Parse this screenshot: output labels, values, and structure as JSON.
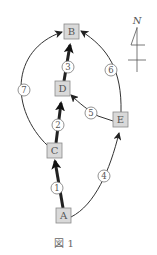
{
  "figure": {
    "caption": "図 1",
    "north_label": "N"
  },
  "nodes": {
    "A": "A",
    "B": "B",
    "C": "C",
    "D": "D",
    "E": "E"
  },
  "edges": [
    {
      "id": "1",
      "label": "1",
      "from": "A",
      "to": "C",
      "weight": "thick"
    },
    {
      "id": "2",
      "label": "2",
      "from": "C",
      "to": "D",
      "weight": "thick"
    },
    {
      "id": "3",
      "label": "3",
      "from": "D",
      "to": "B",
      "weight": "thick"
    },
    {
      "id": "4",
      "label": "4",
      "from": "A",
      "to": "E",
      "weight": "thin"
    },
    {
      "id": "5",
      "label": "5",
      "from": "E",
      "to": "D",
      "weight": "thin"
    },
    {
      "id": "6",
      "label": "6",
      "from": "E",
      "to": "B",
      "weight": "thin"
    },
    {
      "id": "7",
      "label": "7",
      "from": "C",
      "to": "B",
      "weight": "thin"
    }
  ]
}
